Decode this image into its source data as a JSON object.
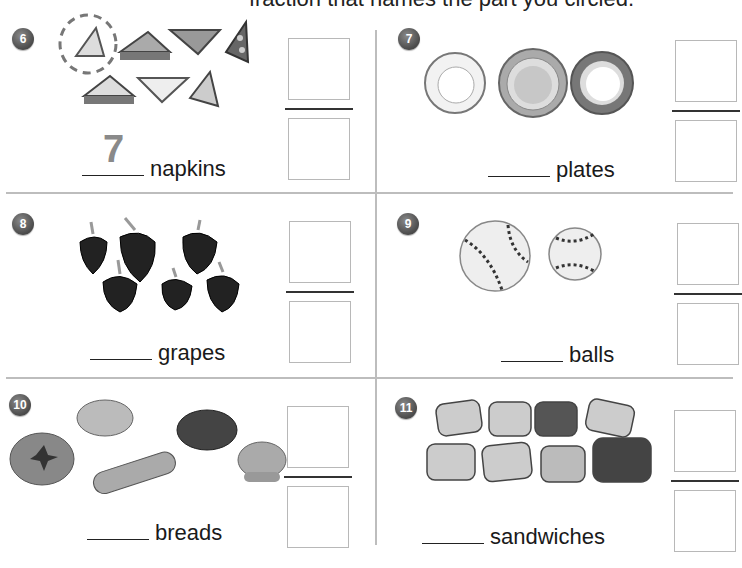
{
  "header": {
    "instruction_partial": "fraction that names the part you circled."
  },
  "problems": [
    {
      "number": "6",
      "noun": "napkins",
      "answer_traced": "7",
      "item_count": 7,
      "circled_count": 1
    },
    {
      "number": "7",
      "noun": "plates",
      "answer_traced": "",
      "item_count": 3
    },
    {
      "number": "8",
      "noun": "grapes",
      "answer_traced": "",
      "item_count": 6
    },
    {
      "number": "9",
      "noun": "balls",
      "answer_traced": "",
      "item_count": 2
    },
    {
      "number": "10",
      "noun": "breads",
      "answer_traced": "",
      "item_count": 5
    },
    {
      "number": "11",
      "noun": "sandwiches",
      "answer_traced": "",
      "item_count": 8
    }
  ],
  "colors": {
    "badge": "#4a4a4a",
    "divider": "#bdbdbd",
    "box_border": "#b8b8b8",
    "fraction_bar": "#333333"
  }
}
